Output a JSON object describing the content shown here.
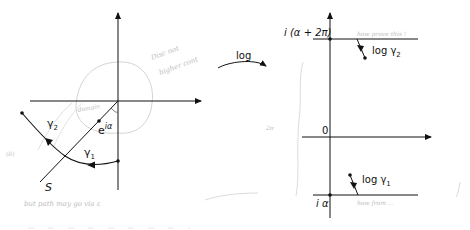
{
  "left_plane": {
    "ray_label": "S",
    "point_label": "e",
    "point_exponent": "iα",
    "curve_label_1": "γ",
    "curve_label_1_sub": "1",
    "curve_label_2": "γ",
    "curve_label_2_sub": "2"
  },
  "map_arrow": {
    "label": "log"
  },
  "right_plane": {
    "top_line_label": "i (α + 2π)",
    "origin_label": "0",
    "bottom_line_label": "i α",
    "image_label_2": "log γ",
    "image_label_2_sub": "2",
    "image_label_1": "log γ",
    "image_label_1_sub": "1"
  },
  "annotations": {
    "pencil_1": "Disc not",
    "pencil_2": "higher cont",
    "pencil_3": "domain",
    "pencil_4": "but path may go via ε",
    "pencil_5": "how prove this !",
    "pencil_6": "how from ...",
    "pencil_7": "2π",
    "pencil_8": "(0)"
  },
  "colors": {
    "ink": "#111111",
    "pencil": "#bdbdbd"
  }
}
